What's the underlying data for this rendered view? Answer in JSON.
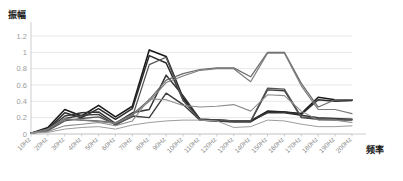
{
  "chart_data": {
    "type": "line",
    "title": "",
    "subtitle": "",
    "xlabel": "频率",
    "ylabel": "振幅",
    "grid": true,
    "legend_position": "none",
    "xlim": [
      0,
      19
    ],
    "ylim": [
      0,
      1.2
    ],
    "ytick_labels": [
      "0",
      "0.2",
      "0.4",
      "0.6",
      "0.8",
      "1",
      "1.2"
    ],
    "ytick_values": [
      0,
      0.2,
      0.4,
      0.6,
      0.8,
      1,
      1.2
    ],
    "categories": [
      "10Hz",
      "20Hz",
      "30Hz",
      "40Hz",
      "50Hz",
      "60Hz",
      "70Hz",
      "80Hz",
      "90Hz",
      "100Hz",
      "110Hz",
      "120Hz",
      "130Hz",
      "140Hz",
      "150Hz",
      "160Hz",
      "170Hz",
      "180Hz",
      "190Hz",
      "200Hz"
    ],
    "series": [
      {
        "name": "series-1",
        "color": "#1a1a1a",
        "width": 1.6,
        "values": [
          0.01,
          0.08,
          0.3,
          0.22,
          0.35,
          0.21,
          0.34,
          1.03,
          0.95,
          0.44,
          0.18,
          0.17,
          0.16,
          0.16,
          0.28,
          0.27,
          0.25,
          0.45,
          0.42,
          0.42
        ]
      },
      {
        "name": "series-2",
        "color": "#2b2b2b",
        "width": 1.5,
        "values": [
          0.01,
          0.06,
          0.26,
          0.2,
          0.31,
          0.18,
          0.31,
          0.96,
          0.87,
          0.42,
          0.17,
          0.16,
          0.15,
          0.15,
          0.27,
          0.27,
          0.24,
          0.42,
          0.4,
          0.41
        ]
      },
      {
        "name": "series-3",
        "color": "#333333",
        "width": 1.5,
        "values": [
          0.01,
          0.05,
          0.22,
          0.26,
          0.27,
          0.13,
          0.26,
          0.3,
          0.72,
          0.47,
          0.18,
          0.17,
          0.16,
          0.16,
          0.26,
          0.26,
          0.23,
          0.2,
          0.19,
          0.18
        ]
      },
      {
        "name": "series-4",
        "color": "#3d3d3d",
        "width": 1.4,
        "values": [
          0.01,
          0.04,
          0.19,
          0.23,
          0.24,
          0.11,
          0.22,
          0.2,
          0.5,
          0.36,
          0.17,
          0.16,
          0.15,
          0.15,
          0.54,
          0.53,
          0.2,
          0.18,
          0.17,
          0.17
        ]
      },
      {
        "name": "series-5",
        "color": "#555555",
        "width": 1.3,
        "values": [
          0.01,
          0.04,
          0.16,
          0.19,
          0.21,
          0.12,
          0.21,
          0.85,
          0.94,
          0.41,
          0.17,
          0.17,
          0.16,
          0.16,
          0.56,
          0.55,
          0.21,
          0.19,
          0.18,
          0.18
        ]
      },
      {
        "name": "series-6",
        "color": "#6b6b6b",
        "width": 1.2,
        "values": [
          0.01,
          0.05,
          0.18,
          0.17,
          0.16,
          0.14,
          0.24,
          0.42,
          0.66,
          0.74,
          0.79,
          0.81,
          0.81,
          0.7,
          1.0,
          1.0,
          0.62,
          0.33,
          0.42,
          0.42
        ]
      },
      {
        "name": "series-7",
        "color": "#7d7d7d",
        "width": 1.2,
        "values": [
          0.01,
          0.06,
          0.19,
          0.17,
          0.15,
          0.13,
          0.23,
          0.4,
          0.63,
          0.71,
          0.78,
          0.8,
          0.8,
          0.64,
          0.99,
          0.99,
          0.59,
          0.3,
          0.3,
          0.25
        ]
      },
      {
        "name": "series-8",
        "color": "#8d8d8d",
        "width": 1.1,
        "values": [
          0.01,
          0.03,
          0.1,
          0.12,
          0.14,
          0.1,
          0.16,
          0.43,
          0.42,
          0.35,
          0.33,
          0.34,
          0.36,
          0.28,
          0.48,
          0.47,
          0.28,
          0.17,
          0.17,
          0.14
        ]
      },
      {
        "name": "series-9",
        "color": "#9c9c9c",
        "width": 1.0,
        "values": [
          0.01,
          0.02,
          0.06,
          0.08,
          0.09,
          0.06,
          0.11,
          0.14,
          0.16,
          0.17,
          0.17,
          0.16,
          0.08,
          0.09,
          0.17,
          0.16,
          0.12,
          0.09,
          0.09,
          0.1
        ]
      }
    ]
  }
}
